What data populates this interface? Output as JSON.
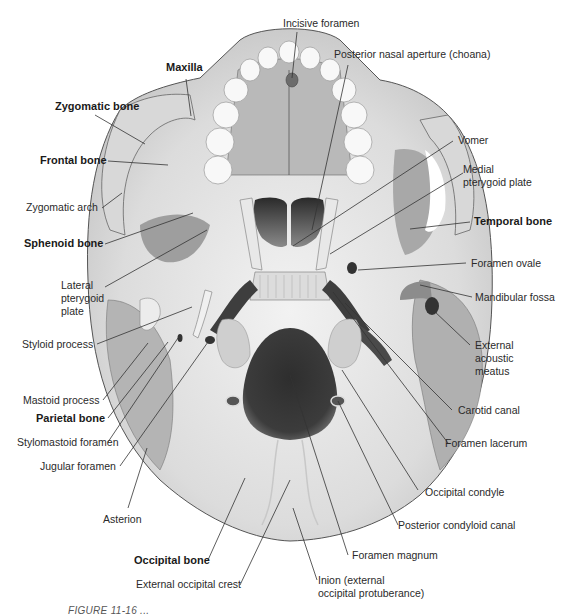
{
  "figure": {
    "colors": {
      "background": "#ffffff",
      "bone_light": "#e4e4e4",
      "bone_mid": "#c2c2c2",
      "bone_dark": "#9a9a9a",
      "cavity": "#3a3a3a",
      "teeth": "#f7f7f7",
      "leader_line": "#333333",
      "label_text": "#2a2a2a"
    },
    "labels": {
      "incisive_foramen": "Incisive foramen",
      "posterior_nasal_aperture": "Posterior nasal aperture (choana)",
      "maxilla": "Maxilla",
      "zygomatic_bone": "Zygomatic bone",
      "frontal_bone": "Frontal bone",
      "zygomatic_arch": "Zygomatic arch",
      "sphenoid_bone": "Sphenoid bone",
      "lateral_pterygoid_plate": "Lateral pterygoid plate",
      "styloid_process": "Styloid process",
      "mastoid_process": "Mastoid process",
      "parietal_bone": "Parietal bone",
      "stylomastoid_foramen": "Stylomastoid foramen",
      "jugular_foramen": "Jugular foramen",
      "asterion": "Asterion",
      "occipital_bone": "Occipital bone",
      "external_occipital_crest": "External occipital crest",
      "inion": "Inion (external occipital protuberance)",
      "foramen_magnum": "Foramen magnum",
      "posterior_condyloid_canal": "Posterior condyloid canal",
      "occipital_condyle": "Occipital condyle",
      "foramen_lacerum": "Foramen lacerum",
      "carotid_canal": "Carotid canal",
      "external_acoustic_meatus": "External acoustic meatus",
      "mandibular_fossa": "Mandibular fossa",
      "foramen_ovale": "Foramen ovale",
      "temporal_bone": "Temporal bone",
      "medial_pterygoid_plate": "Medial pterygoid plate",
      "vomer": "Vomer"
    },
    "label_lines": {
      "lateral_pterygoid_plate": [
        "Lateral",
        "pterygoid",
        "plate"
      ],
      "external_acoustic_meatus": [
        "External",
        "acoustic",
        "meatus"
      ],
      "medial_pterygoid_plate": [
        "Medial",
        "pterygoid plate"
      ],
      "inion": [
        "Inion (external",
        "occipital protuberance)"
      ]
    },
    "caption": "FIGURE 11-16 ..."
  }
}
